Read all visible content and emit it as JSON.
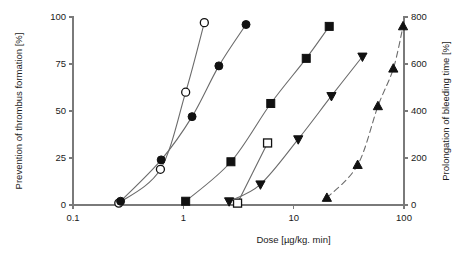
{
  "chart_data": {
    "type": "scatter",
    "title": "",
    "xlabel": "Dose [µg/kg. min]",
    "ylabel": "Prevention of thrombus formation  [%]",
    "y2label": "Prolongation of bleeding time  [%]",
    "xscale": "log",
    "xlim": [
      0.1,
      100
    ],
    "ylim": [
      0,
      100
    ],
    "y2lim": [
      0,
      800
    ],
    "xticks": [
      0.1,
      1,
      10,
      100
    ],
    "xtick_labels": [
      "0.1",
      "1",
      "10",
      "100"
    ],
    "yticks": [
      0,
      25,
      50,
      75,
      100
    ],
    "ytick_labels": [
      "0",
      "25",
      "50",
      "75",
      "100"
    ],
    "y2ticks": [
      0,
      200,
      400,
      600,
      800
    ],
    "y2tick_labels": [
      "0",
      "200",
      "400",
      "600",
      "800"
    ],
    "grid": false,
    "legend": "none",
    "series": [
      {
        "name": "open-circle",
        "marker": "circle-open",
        "line": "solid",
        "axis": "left",
        "x": [
          0.26,
          0.62,
          1.05,
          1.55
        ],
        "y": [
          1,
          19,
          60,
          97
        ]
      },
      {
        "name": "filled-circle",
        "marker": "circle-filled",
        "line": "solid",
        "axis": "left",
        "x": [
          0.27,
          0.63,
          1.2,
          2.1,
          3.7
        ],
        "y": [
          2,
          24,
          47,
          74,
          96
        ]
      },
      {
        "name": "filled-square",
        "marker": "square-filled",
        "line": "solid",
        "axis": "left",
        "x": [
          1.05,
          2.7,
          6.2,
          13.0,
          21.0
        ],
        "y": [
          2,
          23,
          54,
          78,
          95
        ]
      },
      {
        "name": "open-square",
        "marker": "square-open",
        "line": "solid",
        "axis": "left",
        "x": [
          3.1,
          5.8
        ],
        "y": [
          1,
          33
        ]
      },
      {
        "name": "filled-triangle-down",
        "marker": "triangle-down-filled",
        "line": "solid",
        "axis": "left",
        "x": [
          2.6,
          5.0,
          11.0,
          22.0,
          42.0
        ],
        "y": [
          2,
          11,
          35,
          58,
          79
        ]
      },
      {
        "name": "filled-triangle-up",
        "marker": "triangle-up-filled",
        "line": "dashed",
        "axis": "right",
        "x": [
          20.0,
          38.0,
          58.0,
          80.0,
          98.0
        ],
        "y2": [
          30,
          170,
          420,
          580,
          760
        ]
      }
    ]
  },
  "axes": {
    "left_title": "Prevention of thrombus formation  [%]",
    "right_title": "Prolongation of bleeding time  [%]",
    "bottom_title": "Dose [µg/kg. min]"
  },
  "colors": {
    "line": "#6b6b6b",
    "marker": "#111111",
    "axis": "#7a7a7a",
    "text": "#1a1a1a",
    "background": "#ffffff"
  }
}
